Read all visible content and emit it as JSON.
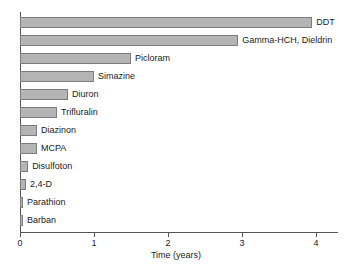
{
  "chart_data": {
    "type": "bar",
    "orientation": "horizontal",
    "title": "",
    "xlabel": "Time (years)",
    "ylabel": "",
    "xlim": [
      0,
      4.3
    ],
    "xticks": [
      0,
      1,
      2,
      3,
      4
    ],
    "xtick_labels": [
      "0",
      "1",
      "2",
      "3",
      "4"
    ],
    "grid": false,
    "legend": "none",
    "categories": [
      "DDT",
      "Gamma-HCH, Dieldrin",
      "Picloram",
      "Simazine",
      "Diuron",
      "Trifluralin",
      "Diazinon",
      "MCPA",
      "Disulfoton",
      "2,4-D",
      "Parathion",
      "Barban"
    ],
    "values": [
      3.95,
      2.95,
      1.5,
      1.0,
      0.65,
      0.5,
      0.23,
      0.23,
      0.11,
      0.08,
      0.04,
      0.04
    ],
    "bar_fill_color": "#b4b4b4",
    "bar_border_color": "#7d7d7d",
    "axis_color": "#555555"
  }
}
